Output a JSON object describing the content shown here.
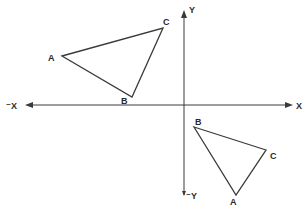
{
  "diagram": {
    "type": "coordinate-plane-rotation",
    "colors": {
      "line": "#3a3a3a",
      "background": "#ffffff"
    },
    "axes": {
      "x_pos_label": "X",
      "x_neg_label": "⁻X",
      "y_pos_label": "Y",
      "y_neg_label": "⁻Y"
    },
    "triangle_1": {
      "quadrant": "II",
      "vertices": {
        "A": "A",
        "B": "B",
        "C": "C"
      }
    },
    "triangle_2": {
      "quadrant": "IV",
      "vertices": {
        "A": "A",
        "B": "B",
        "C": "C"
      }
    }
  }
}
